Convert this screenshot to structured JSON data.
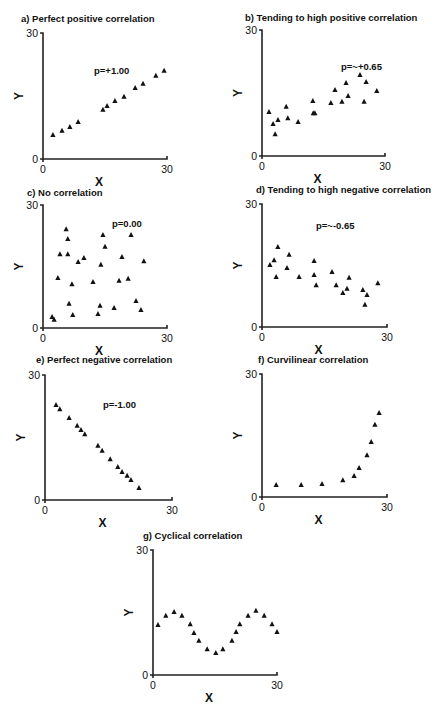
{
  "chart_data": [
    {
      "id": "a",
      "type": "scatter",
      "title": "a) Perfect positive correlation",
      "annotation": "p=+1.00",
      "xlabel": "X",
      "ylabel": "Y",
      "xlim": [
        0,
        30
      ],
      "ylim": [
        0,
        30
      ],
      "xticks": [
        "0",
        "30"
      ],
      "yticks": [
        "0",
        "30"
      ],
      "grid": false,
      "legend": null,
      "marker": "triangle",
      "layout": {
        "x0": 43,
        "x1": 167,
        "y0": 159,
        "y1": 33,
        "tx": 21,
        "ty": 22,
        "ax": 94,
        "ay": 74
      },
      "points": [
        [
          2.4,
          5.7
        ],
        [
          4.6,
          6.7
        ],
        [
          6.5,
          7.6
        ],
        [
          8.5,
          8.8
        ],
        [
          14.5,
          11.7
        ],
        [
          15.5,
          12.6
        ],
        [
          17.4,
          13.8
        ],
        [
          19.6,
          14.8
        ],
        [
          22.3,
          16.9
        ],
        [
          24.2,
          17.9
        ],
        [
          27.3,
          19.8
        ],
        [
          29.3,
          21.0
        ]
      ]
    },
    {
      "id": "b",
      "type": "scatter",
      "title": "b) Tending to high positive correlation",
      "annotation": "p=~+0.65",
      "xlabel": "X",
      "ylabel": "Y",
      "xlim": [
        0,
        30
      ],
      "ylim": [
        0,
        30
      ],
      "xticks": [
        "0",
        "30"
      ],
      "yticks": [
        "0",
        "30"
      ],
      "grid": false,
      "legend": null,
      "marker": "triangle",
      "layout": {
        "x0": 262,
        "x1": 385,
        "y0": 156,
        "y1": 30,
        "tx": 245,
        "ty": 21,
        "ax": 341,
        "ay": 70
      },
      "points": [
        [
          1.7,
          10.5
        ],
        [
          2.7,
          7.6
        ],
        [
          3.9,
          8.6
        ],
        [
          3.2,
          5.2
        ],
        [
          5.9,
          11.7
        ],
        [
          6.3,
          9.0
        ],
        [
          8.8,
          8.1
        ],
        [
          12.4,
          13.1
        ],
        [
          12.5,
          10.2
        ],
        [
          12.9,
          10.2
        ],
        [
          16.8,
          12.6
        ],
        [
          17.8,
          15.7
        ],
        [
          19.5,
          12.9
        ],
        [
          20.5,
          17.4
        ],
        [
          21.0,
          14.3
        ],
        [
          23.9,
          19.3
        ],
        [
          24.9,
          12.9
        ],
        [
          25.4,
          17.6
        ],
        [
          28.0,
          15.5
        ]
      ]
    },
    {
      "id": "c",
      "type": "scatter",
      "title": "c) No correlation",
      "annotation": "p=0.00",
      "xlabel": "X",
      "ylabel": "Y",
      "xlim": [
        0,
        30
      ],
      "ylim": [
        0,
        30
      ],
      "xticks": [
        "0",
        "30"
      ],
      "yticks": [
        "0",
        "30"
      ],
      "grid": false,
      "legend": null,
      "marker": "triangle",
      "layout": {
        "x0": 43,
        "x1": 167,
        "y0": 328,
        "y1": 205,
        "tx": 27,
        "ty": 196,
        "ax": 112,
        "ay": 227
      },
      "points": [
        [
          5.6,
          24.1
        ],
        [
          6.0,
          21.7
        ],
        [
          4.1,
          18.0
        ],
        [
          6.0,
          18.0
        ],
        [
          8.5,
          16.1
        ],
        [
          9.9,
          17.1
        ],
        [
          3.6,
          12.2
        ],
        [
          7.0,
          10.7
        ],
        [
          6.3,
          5.9
        ],
        [
          7.2,
          3.2
        ],
        [
          2.2,
          2.7
        ],
        [
          2.7,
          2.0
        ],
        [
          14.5,
          22.7
        ],
        [
          15.0,
          19.8
        ],
        [
          14.0,
          15.4
        ],
        [
          12.1,
          11.2
        ],
        [
          13.8,
          5.4
        ],
        [
          13.3,
          3.4
        ],
        [
          17.2,
          4.9
        ],
        [
          19.1,
          17.3
        ],
        [
          18.4,
          11.5
        ],
        [
          20.6,
          12.0
        ],
        [
          21.3,
          22.7
        ],
        [
          22.5,
          6.6
        ],
        [
          23.7,
          4.4
        ],
        [
          24.4,
          16.3
        ]
      ]
    },
    {
      "id": "d",
      "type": "scatter",
      "title": "d) Tending to high negative correlation",
      "annotation": "p=~-0.65",
      "xlabel": "X",
      "ylabel": "Y",
      "xlim": [
        0,
        30
      ],
      "ylim": [
        0,
        30
      ],
      "xticks": [
        "0",
        "30"
      ],
      "yticks": [
        "0",
        "30"
      ],
      "grid": false,
      "legend": null,
      "marker": "triangle",
      "layout": {
        "x0": 262,
        "x1": 387,
        "y0": 327,
        "y1": 204,
        "tx": 256,
        "ty": 193,
        "ax": 316,
        "ay": 229
      },
      "points": [
        [
          1.9,
          15.1
        ],
        [
          2.9,
          16.3
        ],
        [
          3.4,
          12.2
        ],
        [
          3.8,
          19.5
        ],
        [
          6.0,
          14.4
        ],
        [
          6.5,
          17.6
        ],
        [
          8.9,
          12.2
        ],
        [
          12.5,
          16.1
        ],
        [
          12.5,
          12.7
        ],
        [
          13.0,
          10.2
        ],
        [
          16.8,
          13.4
        ],
        [
          17.8,
          10.2
        ],
        [
          19.4,
          8.3
        ],
        [
          20.4,
          9.3
        ],
        [
          20.9,
          12.0
        ],
        [
          24.2,
          9.0
        ],
        [
          25.2,
          7.8
        ],
        [
          24.7,
          5.4
        ],
        [
          27.8,
          10.7
        ]
      ]
    },
    {
      "id": "e",
      "type": "scatter",
      "title": "e) Perfect negative correlation",
      "annotation": "p=-1.00",
      "xlabel": "X",
      "ylabel": "Y",
      "xlim": [
        0,
        30
      ],
      "ylim": [
        0,
        30
      ],
      "xticks": [
        "0",
        "30"
      ],
      "yticks": [
        "0",
        "30"
      ],
      "grid": false,
      "legend": null,
      "marker": "triangle",
      "layout": {
        "x0": 45,
        "x1": 172,
        "y0": 500,
        "y1": 375,
        "tx": 36,
        "ty": 363,
        "ax": 103,
        "ay": 408
      },
      "points": [
        [
          2.6,
          22.8
        ],
        [
          3.5,
          21.8
        ],
        [
          5.7,
          19.7
        ],
        [
          7.6,
          17.8
        ],
        [
          8.5,
          16.8
        ],
        [
          9.4,
          15.8
        ],
        [
          12.5,
          13.0
        ],
        [
          13.5,
          11.8
        ],
        [
          15.4,
          9.8
        ],
        [
          17.2,
          7.9
        ],
        [
          18.2,
          6.7
        ],
        [
          19.4,
          5.8
        ],
        [
          20.3,
          4.8
        ],
        [
          22.2,
          2.9
        ]
      ]
    },
    {
      "id": "f",
      "type": "scatter",
      "title": "f) Curvilinear correlation",
      "annotation": "",
      "xlabel": "X",
      "ylabel": "Y",
      "xlim": [
        0,
        30
      ],
      "ylim": [
        0,
        30
      ],
      "xticks": [
        "0",
        "30"
      ],
      "yticks": [
        "0",
        "30"
      ],
      "grid": false,
      "legend": null,
      "marker": "triangle",
      "layout": {
        "x0": 262,
        "x1": 387,
        "y0": 497,
        "y1": 374,
        "tx": 258,
        "ty": 363,
        "ax": 0,
        "ay": 0
      },
      "points": [
        [
          3.4,
          2.9
        ],
        [
          9.4,
          2.9
        ],
        [
          14.4,
          3.2
        ],
        [
          19.4,
          4.1
        ],
        [
          22.1,
          5.1
        ],
        [
          23.3,
          7.1
        ],
        [
          25.2,
          10.2
        ],
        [
          26.2,
          13.4
        ],
        [
          27.1,
          17.6
        ],
        [
          28.1,
          20.5
        ]
      ]
    },
    {
      "id": "g",
      "type": "scatter",
      "title": "g) Cyclical correlation",
      "annotation": "",
      "xlabel": "X",
      "ylabel": "Y",
      "xlim": [
        0,
        30
      ],
      "ylim": [
        0,
        30
      ],
      "xticks": [
        "0",
        "30"
      ],
      "yticks": [
        "0",
        "30"
      ],
      "grid": false,
      "legend": null,
      "marker": "triangle",
      "layout": {
        "x0": 153,
        "x1": 277,
        "y0": 675,
        "y1": 550,
        "tx": 143,
        "ty": 539,
        "ax": 0,
        "ay": 0
      },
      "points": [
        [
          1.2,
          12.0
        ],
        [
          3.1,
          14.2
        ],
        [
          5.1,
          15.1
        ],
        [
          7.0,
          14.2
        ],
        [
          9.0,
          12.2
        ],
        [
          9.9,
          10.1
        ],
        [
          11.1,
          8.2
        ],
        [
          13.1,
          6.2
        ],
        [
          15.2,
          5.3
        ],
        [
          16.9,
          6.2
        ],
        [
          19.1,
          8.2
        ],
        [
          20.1,
          10.3
        ],
        [
          21.0,
          12.2
        ],
        [
          23.0,
          14.2
        ],
        [
          24.9,
          15.4
        ],
        [
          26.9,
          14.2
        ],
        [
          28.8,
          12.2
        ],
        [
          30.0,
          10.3
        ]
      ]
    }
  ]
}
